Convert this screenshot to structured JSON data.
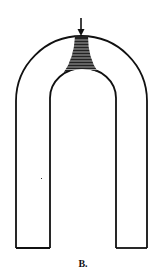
{
  "figure": {
    "label": "B.",
    "colors": {
      "stroke": "#111111",
      "background": "#ffffff"
    },
    "icons": {
      "arrow": "down-arrow-icon"
    }
  }
}
